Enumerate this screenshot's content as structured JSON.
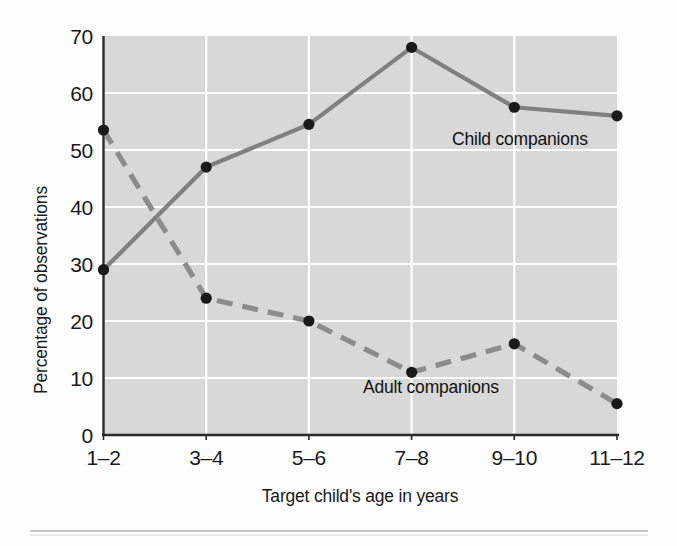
{
  "chart_data": {
    "type": "line",
    "title": "",
    "xlabel": "Target child's age in years",
    "ylabel": "Percentage of observations",
    "categories": [
      "1–2",
      "3–4",
      "5–6",
      "7–8",
      "9–10",
      "11–12"
    ],
    "ylim": [
      0,
      70
    ],
    "yticks": [
      0,
      10,
      20,
      30,
      40,
      50,
      60,
      70
    ],
    "ytick_labels": [
      "0",
      "10",
      "20",
      "30",
      "40",
      "50",
      "60",
      "70"
    ],
    "grid": "white gridlines, horizontal and vertical, on light gray plot background",
    "legend_position": "inline annotations next to each line",
    "series": [
      {
        "name": "Child companions",
        "style": "solid",
        "color": "#808080",
        "marker": "filled circle",
        "marker_color": "#1a1a1a",
        "values": [
          29,
          47,
          54.5,
          68,
          57.5,
          56
        ],
        "label_text": "Child companions"
      },
      {
        "name": "Adult companions",
        "style": "dashed",
        "color": "#8c8c8c",
        "marker": "filled circle",
        "marker_color": "#1a1a1a",
        "values": [
          53.5,
          24,
          20,
          11,
          16,
          5.5
        ],
        "label_text": "Adult companions"
      }
    ],
    "annotations": [
      {
        "text": "Child companions",
        "near": "9–10",
        "value": 54
      },
      {
        "text": "Adult companions",
        "near": "7–8",
        "value": 8.5
      }
    ]
  },
  "figure": {
    "plot_background": "#d8d8d8",
    "gridline_color": "#ffffff",
    "axis_color": "#2b2b2b",
    "footer_rule": true
  }
}
